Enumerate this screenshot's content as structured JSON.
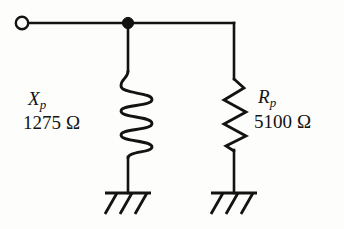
{
  "diagram": {
    "type": "electrical-circuit-schematic",
    "stroke_color": "#131313",
    "background_color": "#fdfdfb",
    "terminal": {
      "name": "input-terminal",
      "style": "open-circle",
      "cx": 22,
      "cy": 23,
      "r": 6
    },
    "node": {
      "name": "junction-node",
      "style": "filled-dot",
      "cx": 128,
      "cy": 23,
      "r": 5.5
    },
    "top_wire": {
      "y": 23,
      "x_start": 28,
      "x_end": 234
    },
    "branches": [
      {
        "id": "inductive-branch",
        "component": "inductor",
        "symbol": "coil",
        "coil_turns": 3,
        "x": 128,
        "symbol_top": 70,
        "symbol_bottom": 158,
        "ground_y": 193,
        "label_name": "X",
        "label_subscript": "p",
        "label_value": "1275",
        "label_unit": "Ω"
      },
      {
        "id": "resistive-branch",
        "component": "resistor",
        "symbol": "zigzag",
        "zigzag_peaks": 6,
        "x": 234,
        "symbol_top": 78,
        "symbol_bottom": 150,
        "ground_y": 193,
        "label_name": "R",
        "label_subscript": "p",
        "label_value": "5100",
        "label_unit": "Ω"
      }
    ],
    "grounds": [
      {
        "name": "ground-left",
        "x": 128,
        "bar_y": 193,
        "bar_half_width": 23,
        "hatch_count": 3
      },
      {
        "name": "ground-right",
        "x": 234,
        "bar_y": 193,
        "bar_half_width": 23,
        "hatch_count": 3
      }
    ]
  }
}
